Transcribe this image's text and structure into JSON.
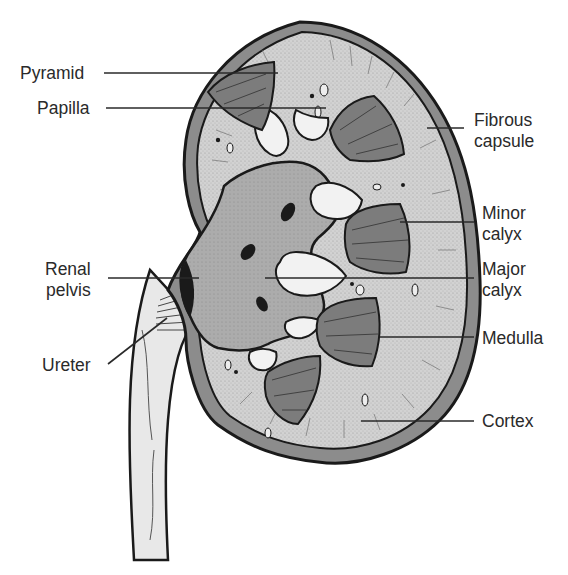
{
  "diagram": {
    "colors": {
      "background": "#ffffff",
      "outline": "#1a1a1a",
      "capsule": "#8a8a8a",
      "cortex": "#cfcfcf",
      "pyramid": "#7a7a7a",
      "pelvis": "#a9a9a9",
      "calyx_interior": "#f2f2f2",
      "ureter": "#e6e6e6",
      "leader_line": "#2a2a2a",
      "label_text": "#2a2a2a"
    },
    "labels": [
      {
        "id": "pyramid",
        "text": "Pyramid",
        "side": "left",
        "x": 20,
        "y": 63,
        "line": [
          104,
          73,
          278,
          73
        ]
      },
      {
        "id": "papilla",
        "text": "Papilla",
        "side": "left",
        "x": 37,
        "y": 98,
        "line": [
          106,
          108,
          326,
          108
        ]
      },
      {
        "id": "fibrous-capsule",
        "text": "Fibrous\ncapsule",
        "side": "right",
        "x": 474,
        "y": 110,
        "line": [
          427,
          128,
          464,
          128
        ]
      },
      {
        "id": "minor-calyx",
        "text": "Minor\ncalyx",
        "side": "right",
        "x": 482,
        "y": 203,
        "line": [
          400,
          222,
          474,
          222
        ]
      },
      {
        "id": "major-calyx",
        "text": "Major\ncalyx",
        "side": "right",
        "x": 482,
        "y": 259,
        "line": [
          265,
          278,
          474,
          278
        ]
      },
      {
        "id": "renal-pelvis",
        "text": "Renal\npelvis",
        "side": "left",
        "x": 45,
        "y": 259,
        "line": [
          108,
          278,
          199,
          278
        ]
      },
      {
        "id": "medulla",
        "text": "Medulla",
        "side": "right",
        "x": 482,
        "y": 328,
        "line": [
          380,
          337,
          474,
          337
        ]
      },
      {
        "id": "ureter",
        "text": "Ureter",
        "side": "left",
        "x": 42,
        "y": 355,
        "line": [
          108,
          364,
          167,
          318
        ]
      },
      {
        "id": "cortex",
        "text": "Cortex",
        "side": "right",
        "x": 482,
        "y": 411,
        "line": [
          361,
          421,
          474,
          421
        ]
      }
    ]
  }
}
